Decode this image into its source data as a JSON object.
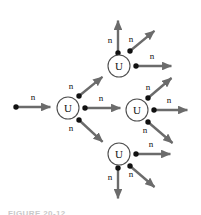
{
  "figure": {
    "domain": "Diagram",
    "caption": "FIGURE 20-12",
    "colors": {
      "arrow": "#6b6b6b",
      "dot": "#111111",
      "nucleus_stroke": "#4f4f4f",
      "text": "#111111",
      "background": "#ffffff",
      "caption": "#c9c9c9"
    },
    "nucleus_label": "U",
    "neutron_label": "n"
  },
  "nuclei": [
    {
      "id": "u1",
      "label": "U",
      "cx": 68,
      "cy": 108,
      "r": 11
    },
    {
      "id": "u2",
      "label": "U",
      "cx": 119,
      "cy": 66,
      "r": 11
    },
    {
      "id": "u3",
      "label": "U",
      "cx": 137,
      "cy": 110,
      "r": 11
    },
    {
      "id": "u4",
      "label": "U",
      "cx": 119,
      "cy": 154,
      "r": 11
    }
  ],
  "neutrons": [
    {
      "id": "n-incoming",
      "label": "n",
      "dot": [
        16,
        107
      ],
      "tip": [
        55,
        107
      ],
      "label_pos": [
        33,
        100
      ]
    },
    {
      "id": "n-u1-up",
      "label": "n",
      "dot": [
        79,
        96
      ],
      "tip": [
        106,
        74
      ],
      "label_pos": [
        71,
        89
      ]
    },
    {
      "id": "n-u1-right",
      "label": "n",
      "dot": [
        85,
        108
      ],
      "tip": [
        125,
        108
      ],
      "label_pos": [
        101,
        101
      ]
    },
    {
      "id": "n-u1-down",
      "label": "n",
      "dot": [
        79,
        120
      ],
      "tip": [
        106,
        145
      ],
      "label_pos": [
        71,
        131
      ]
    },
    {
      "id": "n-u2-up",
      "label": "n",
      "dot": [
        118,
        53
      ],
      "tip": [
        118,
        16
      ],
      "label_pos": [
        110,
        43
      ]
    },
    {
      "id": "n-u2-diag",
      "label": "n",
      "dot": [
        130,
        51
      ],
      "tip": [
        158,
        28
      ],
      "label_pos": [
        131,
        42
      ]
    },
    {
      "id": "n-u2-right",
      "label": "n",
      "dot": [
        136,
        66
      ],
      "tip": [
        176,
        66
      ],
      "label_pos": [
        152,
        59
      ]
    },
    {
      "id": "n-u3-up",
      "label": "n",
      "dot": [
        148,
        98
      ],
      "tip": [
        175,
        75
      ],
      "label_pos": [
        148,
        90
      ]
    },
    {
      "id": "n-u3-right",
      "label": "n",
      "dot": [
        154,
        110
      ],
      "tip": [
        192,
        110
      ],
      "label_pos": [
        169,
        103
      ]
    },
    {
      "id": "n-u3-down",
      "label": "n",
      "dot": [
        148,
        122
      ],
      "tip": [
        176,
        146
      ],
      "label_pos": [
        145,
        133
      ]
    },
    {
      "id": "n-u4-right",
      "label": "n",
      "dot": [
        136,
        154
      ],
      "tip": [
        175,
        154
      ],
      "label_pos": [
        151,
        147
      ]
    },
    {
      "id": "n-u4-diag",
      "label": "n",
      "dot": [
        130,
        166
      ],
      "tip": [
        158,
        190
      ],
      "label_pos": [
        131,
        177
      ]
    },
    {
      "id": "n-u4-down",
      "label": "n",
      "dot": [
        118,
        168
      ],
      "tip": [
        118,
        203
      ],
      "label_pos": [
        110,
        180
      ]
    }
  ]
}
